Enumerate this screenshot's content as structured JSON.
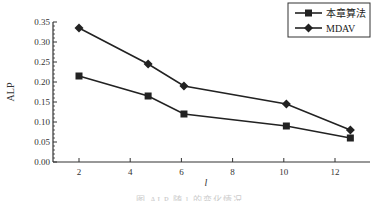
{
  "chart_data": {
    "type": "line",
    "title": "",
    "xlabel": "l",
    "ylabel": "ALP",
    "xlim": [
      1.0,
      13.6
    ],
    "ylim": [
      0.0,
      0.35
    ],
    "xticks": [
      2,
      4,
      6,
      8,
      10,
      12
    ],
    "yticks": [
      "0.00",
      "0.05",
      "0.10",
      "0.15",
      "0.20",
      "0.25",
      "0.30",
      "0.35"
    ],
    "grid": false,
    "legend_position": "upper right",
    "series": [
      {
        "name": "本章算法",
        "marker": "square",
        "x": [
          2,
          4.7,
          6.1,
          10.1,
          12.6
        ],
        "values": [
          0.215,
          0.165,
          0.12,
          0.09,
          0.06
        ]
      },
      {
        "name": "MDAV",
        "marker": "diamond",
        "x": [
          2,
          4.7,
          6.1,
          10.1,
          12.6
        ],
        "values": [
          0.335,
          0.245,
          0.19,
          0.145,
          0.08
        ]
      }
    ]
  },
  "legend": {
    "items": [
      "本章算法",
      "MDAV"
    ]
  },
  "caption": "图 ALP 随 l 的变化情况",
  "colors": {
    "line": "#222222",
    "axis": "#333333"
  }
}
